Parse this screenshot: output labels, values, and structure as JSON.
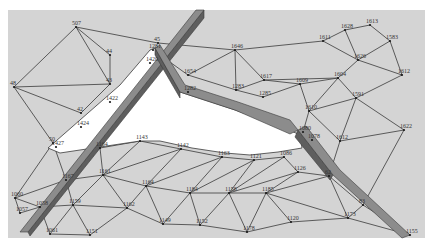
{
  "diagram": {
    "type": "triangular-mesh",
    "colors": {
      "page_background": "#ffffff",
      "mesh_background": "#d4d4d4",
      "hole": "#ffffff",
      "edge": "#3a3a3a",
      "strip_top": "#8c8c8c",
      "strip_side": "#5e5e5e"
    },
    "mesh_bounds": {
      "x": 8,
      "y": 10,
      "width": 417,
      "height": 228
    },
    "hole_polygon": [
      [
        155,
        48
      ],
      [
        180,
        92
      ],
      [
        235,
        110
      ],
      [
        285,
        128
      ],
      [
        300,
        135
      ],
      [
        302,
        148
      ],
      [
        278,
        152
      ],
      [
        250,
        155
      ],
      [
        225,
        153
      ],
      [
        192,
        148
      ],
      [
        160,
        141
      ],
      [
        140,
        141
      ],
      [
        100,
        147
      ],
      [
        60,
        153
      ],
      [
        48,
        148
      ],
      [
        80,
        120
      ],
      [
        120,
        85
      ],
      [
        150,
        50
      ]
    ],
    "strips": [
      {
        "name": "left-fracture-strip",
        "top": [
          [
            20,
            232
          ],
          [
            196,
            10
          ],
          [
            204,
            10
          ],
          [
            28,
            232
          ]
        ],
        "side": [
          [
            28,
            232
          ],
          [
            204,
            10
          ],
          [
            204,
            18
          ],
          [
            30,
            236
          ]
        ]
      },
      {
        "name": "upper-wall-strip",
        "top": [
          [
            155,
            48
          ],
          [
            160,
            45
          ],
          [
            185,
            85
          ],
          [
            238,
            102
          ],
          [
            290,
            120
          ],
          [
            298,
            130
          ],
          [
            290,
            134
          ],
          [
            235,
            110
          ],
          [
            180,
            92
          ]
        ],
        "side": [
          [
            155,
            48
          ],
          [
            180,
            92
          ],
          [
            180,
            98
          ],
          [
            155,
            55
          ]
        ]
      },
      {
        "name": "right-fracture-strip",
        "top": [
          [
            298,
            130
          ],
          [
            306,
            126
          ],
          [
            340,
            170
          ],
          [
            410,
            235
          ],
          [
            402,
            238
          ],
          [
            333,
            175
          ]
        ],
        "side": [
          [
            298,
            130
          ],
          [
            333,
            175
          ],
          [
            330,
            180
          ],
          [
            295,
            137
          ]
        ]
      }
    ],
    "nodes": [
      {
        "id": "n1",
        "x": 76,
        "y": 27,
        "label": "507"
      },
      {
        "id": "n2",
        "x": 14,
        "y": 87,
        "label": "48"
      },
      {
        "id": "n3",
        "x": 110,
        "y": 55,
        "label": "44"
      },
      {
        "id": "n4",
        "x": 158,
        "y": 43,
        "label": "45"
      },
      {
        "id": "n5",
        "x": 153,
        "y": 50,
        "label": "1281"
      },
      {
        "id": "n6",
        "x": 150,
        "y": 63,
        "label": "1420"
      },
      {
        "id": "n7",
        "x": 110,
        "y": 84,
        "label": "43"
      },
      {
        "id": "n8",
        "x": 110,
        "y": 102,
        "label": "1422"
      },
      {
        "id": "n9",
        "x": 81,
        "y": 113,
        "label": "42"
      },
      {
        "id": "n10",
        "x": 81,
        "y": 127,
        "label": "1424"
      },
      {
        "id": "n11",
        "x": 53,
        "y": 143,
        "label": "50"
      },
      {
        "id": "n12",
        "x": 56,
        "y": 147,
        "label": "1427"
      },
      {
        "id": "n13",
        "x": 188,
        "y": 75,
        "label": "1654"
      },
      {
        "id": "n14",
        "x": 188,
        "y": 92,
        "label": "1282"
      },
      {
        "id": "n15",
        "x": 235,
        "y": 50,
        "label": "1646"
      },
      {
        "id": "n16",
        "x": 236,
        "y": 90,
        "label": "1283"
      },
      {
        "id": "n17",
        "x": 264,
        "y": 80,
        "label": "1617"
      },
      {
        "id": "n18",
        "x": 263,
        "y": 97,
        "label": "1285"
      },
      {
        "id": "n19",
        "x": 300,
        "y": 84,
        "label": "1609"
      },
      {
        "id": "n20",
        "x": 323,
        "y": 41,
        "label": "1611"
      },
      {
        "id": "n21",
        "x": 345,
        "y": 30,
        "label": "1628"
      },
      {
        "id": "n22",
        "x": 370,
        "y": 25,
        "label": "1613"
      },
      {
        "id": "n23",
        "x": 390,
        "y": 41,
        "label": "1583"
      },
      {
        "id": "n24",
        "x": 358,
        "y": 60,
        "label": "1626"
      },
      {
        "id": "n25",
        "x": 402,
        "y": 75,
        "label": "1612"
      },
      {
        "id": "n26",
        "x": 338,
        "y": 78,
        "label": "1604"
      },
      {
        "id": "n27",
        "x": 356,
        "y": 98,
        "label": "1591"
      },
      {
        "id": "n28",
        "x": 309,
        "y": 111,
        "label": "1610"
      },
      {
        "id": "n29",
        "x": 303,
        "y": 132,
        "label": "1080"
      },
      {
        "id": "n30",
        "x": 312,
        "y": 140,
        "label": "1078"
      },
      {
        "id": "n31",
        "x": 340,
        "y": 141,
        "label": "1612"
      },
      {
        "id": "n32",
        "x": 404,
        "y": 130,
        "label": "1622"
      },
      {
        "id": "n33",
        "x": 140,
        "y": 141,
        "label": "1143"
      },
      {
        "id": "n34",
        "x": 100,
        "y": 148,
        "label": "1164"
      },
      {
        "id": "n35",
        "x": 181,
        "y": 149,
        "label": "1142"
      },
      {
        "id": "n36",
        "x": 222,
        "y": 157,
        "label": "1163"
      },
      {
        "id": "n37",
        "x": 254,
        "y": 160,
        "label": "1121"
      },
      {
        "id": "n38",
        "x": 284,
        "y": 157,
        "label": "1086"
      },
      {
        "id": "n39",
        "x": 298,
        "y": 172,
        "label": "1126"
      },
      {
        "id": "n40",
        "x": 66,
        "y": 180,
        "label": "1167"
      },
      {
        "id": "n41",
        "x": 103,
        "y": 175,
        "label": "1161"
      },
      {
        "id": "n42",
        "x": 146,
        "y": 186,
        "label": "1164"
      },
      {
        "id": "n43",
        "x": 190,
        "y": 193,
        "label": "1184"
      },
      {
        "id": "n44",
        "x": 229,
        "y": 193,
        "label": "1158"
      },
      {
        "id": "n45",
        "x": 266,
        "y": 193,
        "label": "1185"
      },
      {
        "id": "n46",
        "x": 329,
        "y": 176,
        "label": "62"
      },
      {
        "id": "n47",
        "x": 348,
        "y": 218,
        "label": "1173"
      },
      {
        "id": "n48",
        "x": 363,
        "y": 205,
        "label": "83"
      },
      {
        "id": "n49",
        "x": 15,
        "y": 198,
        "label": "1060"
      },
      {
        "id": "n50",
        "x": 40,
        "y": 207,
        "label": "1058"
      },
      {
        "id": "n51",
        "x": 20,
        "y": 213,
        "label": "1057"
      },
      {
        "id": "n52",
        "x": 73,
        "y": 205,
        "label": "1159"
      },
      {
        "id": "n53",
        "x": 127,
        "y": 208,
        "label": "1162"
      },
      {
        "id": "n54",
        "x": 163,
        "y": 224,
        "label": "1149"
      },
      {
        "id": "n55",
        "x": 200,
        "y": 225,
        "label": "1152"
      },
      {
        "id": "n56",
        "x": 247,
        "y": 232,
        "label": "1178"
      },
      {
        "id": "n57",
        "x": 291,
        "y": 222,
        "label": "1120"
      },
      {
        "id": "n58",
        "x": 410,
        "y": 235,
        "label": "1155"
      },
      {
        "id": "n59",
        "x": 50,
        "y": 234,
        "label": "1061"
      },
      {
        "id": "n60",
        "x": 90,
        "y": 235,
        "label": "1151"
      }
    ],
    "edges": [
      [
        "n1",
        "n2"
      ],
      [
        "n1",
        "n3"
      ],
      [
        "n1",
        "n7"
      ],
      [
        "n2",
        "n7"
      ],
      [
        "n2",
        "n9"
      ],
      [
        "n1",
        "n4"
      ],
      [
        "n3",
        "n7"
      ],
      [
        "n7",
        "n9"
      ],
      [
        "n2",
        "n11"
      ],
      [
        "n4",
        "n15"
      ],
      [
        "n5",
        "n13"
      ],
      [
        "n13",
        "n15"
      ],
      [
        "n13",
        "n16"
      ],
      [
        "n15",
        "n16"
      ],
      [
        "n15",
        "n17"
      ],
      [
        "n16",
        "n17"
      ],
      [
        "n17",
        "n19"
      ],
      [
        "n15",
        "n20"
      ],
      [
        "n20",
        "n21"
      ],
      [
        "n21",
        "n22"
      ],
      [
        "n22",
        "n23"
      ],
      [
        "n20",
        "n24"
      ],
      [
        "n21",
        "n24"
      ],
      [
        "n23",
        "n24"
      ],
      [
        "n23",
        "n25"
      ],
      [
        "n24",
        "n25"
      ],
      [
        "n24",
        "n26"
      ],
      [
        "n17",
        "n26"
      ],
      [
        "n19",
        "n26"
      ],
      [
        "n26",
        "n27"
      ],
      [
        "n25",
        "n27"
      ],
      [
        "n19",
        "n28"
      ],
      [
        "n26",
        "n28"
      ],
      [
        "n27",
        "n28"
      ],
      [
        "n28",
        "n29"
      ],
      [
        "n27",
        "n31"
      ],
      [
        "n28",
        "n31"
      ],
      [
        "n27",
        "n32"
      ],
      [
        "n31",
        "n32"
      ],
      [
        "n16",
        "n18"
      ],
      [
        "n18",
        "n19"
      ],
      [
        "n33",
        "n34"
      ],
      [
        "n33",
        "n35"
      ],
      [
        "n34",
        "n40"
      ],
      [
        "n34",
        "n41"
      ],
      [
        "n33",
        "n41"
      ],
      [
        "n35",
        "n41"
      ],
      [
        "n35",
        "n42"
      ],
      [
        "n41",
        "n42"
      ],
      [
        "n35",
        "n36"
      ],
      [
        "n36",
        "n42"
      ],
      [
        "n36",
        "n43"
      ],
      [
        "n42",
        "n43"
      ],
      [
        "n36",
        "n37"
      ],
      [
        "n37",
        "n43"
      ],
      [
        "n37",
        "n44"
      ],
      [
        "n43",
        "n44"
      ],
      [
        "n37",
        "n38"
      ],
      [
        "n38",
        "n44"
      ],
      [
        "n38",
        "n39"
      ],
      [
        "n39",
        "n44"
      ],
      [
        "n39",
        "n45"
      ],
      [
        "n44",
        "n45"
      ],
      [
        "n39",
        "n46"
      ],
      [
        "n45",
        "n46"
      ],
      [
        "n31",
        "n46"
      ],
      [
        "n46",
        "n48"
      ],
      [
        "n32",
        "n48"
      ],
      [
        "n46",
        "n47"
      ],
      [
        "n47",
        "n48"
      ],
      [
        "n45",
        "n47"
      ],
      [
        "n48",
        "n58"
      ],
      [
        "n47",
        "n58"
      ],
      [
        "n40",
        "n41"
      ],
      [
        "n40",
        "n52"
      ],
      [
        "n41",
        "n52"
      ],
      [
        "n42",
        "n53"
      ],
      [
        "n52",
        "n53"
      ],
      [
        "n41",
        "n53"
      ],
      [
        "n53",
        "n54"
      ],
      [
        "n42",
        "n54"
      ],
      [
        "n43",
        "n54"
      ],
      [
        "n43",
        "n55"
      ],
      [
        "n54",
        "n55"
      ],
      [
        "n44",
        "n55"
      ],
      [
        "n55",
        "n56"
      ],
      [
        "n44",
        "n56"
      ],
      [
        "n45",
        "n56"
      ],
      [
        "n56",
        "n57"
      ],
      [
        "n45",
        "n57"
      ],
      [
        "n47",
        "n57"
      ],
      [
        "n49",
        "n50"
      ],
      [
        "n50",
        "n51"
      ],
      [
        "n49",
        "n51"
      ],
      [
        "n40",
        "n50"
      ],
      [
        "n50",
        "n52"
      ],
      [
        "n52",
        "n59"
      ],
      [
        "n50",
        "n59"
      ],
      [
        "n52",
        "n60"
      ],
      [
        "n53",
        "n60"
      ],
      [
        "n59",
        "n60"
      ],
      [
        "n11",
        "n40"
      ],
      [
        "n11",
        "n49"
      ],
      [
        "n40",
        "n49"
      ]
    ]
  }
}
